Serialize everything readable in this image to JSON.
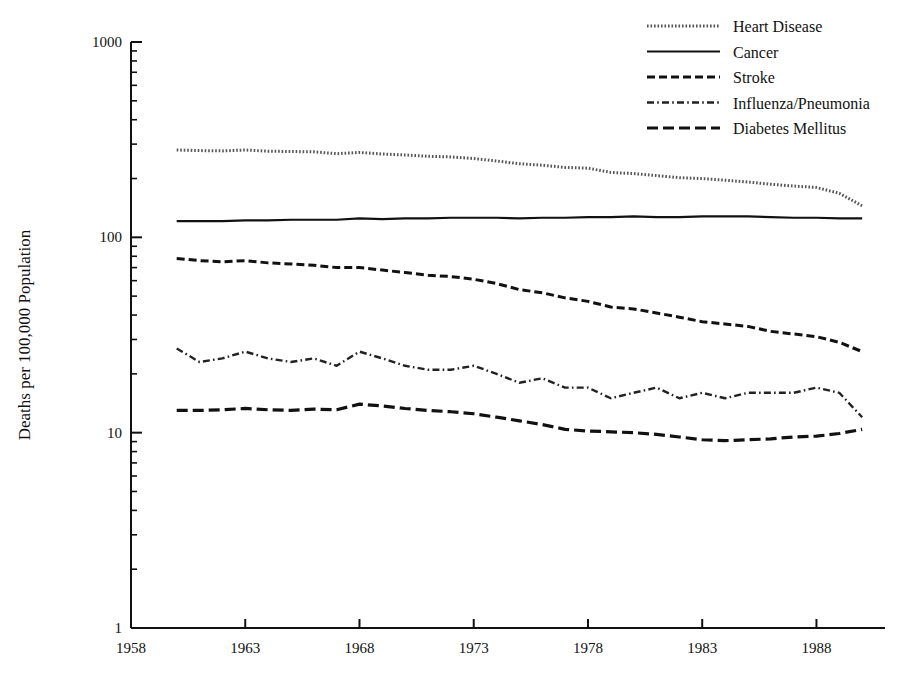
{
  "chart_data": {
    "type": "line",
    "title": "",
    "xlabel": "",
    "ylabel": "Deaths per 100,000 Population",
    "yscale": "log",
    "ylim": [
      1,
      1000
    ],
    "xlim": [
      1958,
      1991
    ],
    "grid": false,
    "legend_position": "top-right",
    "ytick_labels": [
      "1000",
      "100",
      "10",
      "1"
    ],
    "ytick_values": [
      1000,
      100,
      10,
      1
    ],
    "xtick_labels": [
      "1958",
      "1963",
      "1968",
      "1973",
      "1978",
      "1983",
      "1988"
    ],
    "xtick_values": [
      1958,
      1963,
      1968,
      1973,
      1978,
      1983,
      1988
    ],
    "x": [
      1960,
      1961,
      1962,
      1963,
      1964,
      1965,
      1966,
      1967,
      1968,
      1969,
      1970,
      1971,
      1972,
      1973,
      1974,
      1975,
      1976,
      1977,
      1978,
      1979,
      1980,
      1981,
      1982,
      1983,
      1984,
      1985,
      1986,
      1987,
      1988,
      1989,
      1990
    ],
    "series": [
      {
        "name": "Heart Disease",
        "linestyle": "dotted",
        "color": "#555555",
        "values": [
          280,
          278,
          277,
          280,
          276,
          275,
          274,
          268,
          272,
          267,
          264,
          260,
          258,
          253,
          246,
          238,
          234,
          228,
          226,
          215,
          212,
          207,
          202,
          200,
          196,
          192,
          187,
          183,
          180,
          168,
          145
        ]
      },
      {
        "name": "Cancer",
        "linestyle": "solid",
        "color": "#111111",
        "values": [
          121,
          121,
          121,
          122,
          122,
          123,
          123,
          123,
          125,
          124,
          125,
          125,
          126,
          126,
          126,
          125,
          126,
          126,
          127,
          127,
          128,
          127,
          127,
          128,
          128,
          128,
          127,
          126,
          126,
          125,
          125
        ]
      },
      {
        "name": "Stroke",
        "linestyle": "dashed",
        "color": "#111111",
        "values": [
          78,
          76,
          75,
          76,
          74,
          73,
          72,
          70,
          70,
          68,
          66,
          64,
          63,
          61,
          58,
          54,
          52,
          49,
          47,
          44,
          43,
          41,
          39,
          37,
          36,
          35,
          33,
          32,
          31,
          29,
          26
        ]
      },
      {
        "name": "Influenza/Pneumonia",
        "linestyle": "dashdot",
        "color": "#222222",
        "values": [
          27,
          23,
          24,
          26,
          24,
          23,
          24,
          22,
          26,
          24,
          22,
          21,
          21,
          22,
          20,
          18,
          19,
          17,
          17,
          15,
          16,
          17,
          15,
          16,
          15,
          16,
          16,
          16,
          17,
          16,
          12
        ]
      },
      {
        "name": "Diabetes Mellitus",
        "linestyle": "dashed-long",
        "color": "#111111",
        "values": [
          13.0,
          13.0,
          13.1,
          13.3,
          13.1,
          13.0,
          13.2,
          13.1,
          14.0,
          13.7,
          13.3,
          13.0,
          12.8,
          12.5,
          12.0,
          11.5,
          11.0,
          10.4,
          10.2,
          10.1,
          10.0,
          9.8,
          9.5,
          9.2,
          9.1,
          9.2,
          9.3,
          9.5,
          9.6,
          9.9,
          10.4
        ]
      }
    ]
  }
}
